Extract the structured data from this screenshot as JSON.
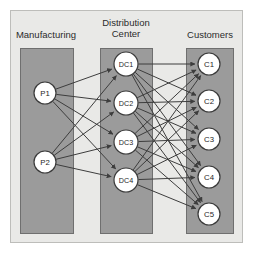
{
  "diagram": {
    "type": "three-stage-bipartite-network",
    "frame": {
      "x": 10,
      "y": 10,
      "w": 233,
      "h": 233,
      "fill": "#e9e9e7",
      "stroke": "#bdbdba"
    },
    "column_fill": "#9b9b9b",
    "column_stroke": "#6f6f6f",
    "node_fill": "#ffffff",
    "node_stroke": "#3a3a3a",
    "edge_color": "#3d3d3d",
    "label_color": "#2b2b2b",
    "columns": [
      {
        "id": "manufacturing",
        "label": "Manufacturing",
        "label_lines": [
          "Manufacturing"
        ],
        "label_x": 46,
        "label_y": 38,
        "x": 20,
        "y": 48,
        "w": 53,
        "h": 185
      },
      {
        "id": "distribution-center",
        "label": "Distribution Center",
        "label_lines": [
          "Distribution",
          "Center"
        ],
        "label_x": 126,
        "label_y": 26,
        "x": 100,
        "y": 48,
        "w": 52,
        "h": 185
      },
      {
        "id": "customers",
        "label": "Customers",
        "label_lines": [
          "Customers"
        ],
        "label_x": 210,
        "label_y": 38,
        "x": 186,
        "y": 48,
        "w": 47,
        "h": 185
      }
    ],
    "nodes": [
      {
        "id": "P1",
        "label": "P1",
        "stage": "manufacturing",
        "cx": 45,
        "cy": 93,
        "r": 11
      },
      {
        "id": "P2",
        "label": "P2",
        "stage": "manufacturing",
        "cx": 45,
        "cy": 162,
        "r": 11
      },
      {
        "id": "DC1",
        "label": "DC1",
        "stage": "distribution-center",
        "cx": 126,
        "cy": 64,
        "r": 12
      },
      {
        "id": "DC2",
        "label": "DC2",
        "stage": "distribution-center",
        "cx": 126,
        "cy": 103,
        "r": 12
      },
      {
        "id": "DC3",
        "label": "DC3",
        "stage": "distribution-center",
        "cx": 126,
        "cy": 142,
        "r": 12
      },
      {
        "id": "DC4",
        "label": "DC4",
        "stage": "distribution-center",
        "cx": 126,
        "cy": 180,
        "r": 12
      },
      {
        "id": "C1",
        "label": "C1",
        "stage": "customers",
        "cx": 209,
        "cy": 64,
        "r": 11
      },
      {
        "id": "C2",
        "label": "C2",
        "stage": "customers",
        "cx": 209,
        "cy": 101,
        "r": 11
      },
      {
        "id": "C3",
        "label": "C3",
        "stage": "customers",
        "cx": 209,
        "cy": 139,
        "r": 11
      },
      {
        "id": "C4",
        "label": "C4",
        "stage": "customers",
        "cx": 209,
        "cy": 177,
        "r": 11
      },
      {
        "id": "C5",
        "label": "C5",
        "stage": "customers",
        "cx": 209,
        "cy": 214,
        "r": 11
      }
    ],
    "edges": [
      {
        "from": "P1",
        "to": "DC1"
      },
      {
        "from": "P1",
        "to": "DC2"
      },
      {
        "from": "P1",
        "to": "DC3"
      },
      {
        "from": "P1",
        "to": "DC4"
      },
      {
        "from": "P2",
        "to": "DC1"
      },
      {
        "from": "P2",
        "to": "DC2"
      },
      {
        "from": "P2",
        "to": "DC3"
      },
      {
        "from": "P2",
        "to": "DC4"
      },
      {
        "from": "DC1",
        "to": "C1"
      },
      {
        "from": "DC1",
        "to": "C2"
      },
      {
        "from": "DC1",
        "to": "C3"
      },
      {
        "from": "DC1",
        "to": "C4"
      },
      {
        "from": "DC1",
        "to": "C5"
      },
      {
        "from": "DC2",
        "to": "C1"
      },
      {
        "from": "DC2",
        "to": "C2"
      },
      {
        "from": "DC2",
        "to": "C3"
      },
      {
        "from": "DC2",
        "to": "C4"
      },
      {
        "from": "DC2",
        "to": "C5"
      },
      {
        "from": "DC3",
        "to": "C1"
      },
      {
        "from": "DC3",
        "to": "C2"
      },
      {
        "from": "DC3",
        "to": "C3"
      },
      {
        "from": "DC3",
        "to": "C4"
      },
      {
        "from": "DC3",
        "to": "C5"
      },
      {
        "from": "DC4",
        "to": "C1"
      },
      {
        "from": "DC4",
        "to": "C2"
      },
      {
        "from": "DC4",
        "to": "C3"
      },
      {
        "from": "DC4",
        "to": "C4"
      },
      {
        "from": "DC4",
        "to": "C5"
      }
    ]
  }
}
